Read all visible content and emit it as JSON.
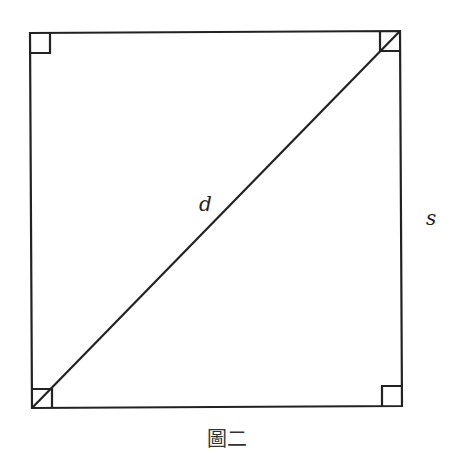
{
  "diagram": {
    "type": "square-with-diagonal",
    "labels": {
      "diagonal": "d",
      "side": "s"
    },
    "caption": "圖二",
    "right_angle_markers": [
      "top-left",
      "top-right",
      "bottom-left",
      "bottom-right"
    ],
    "stroke_color": "#222222"
  }
}
